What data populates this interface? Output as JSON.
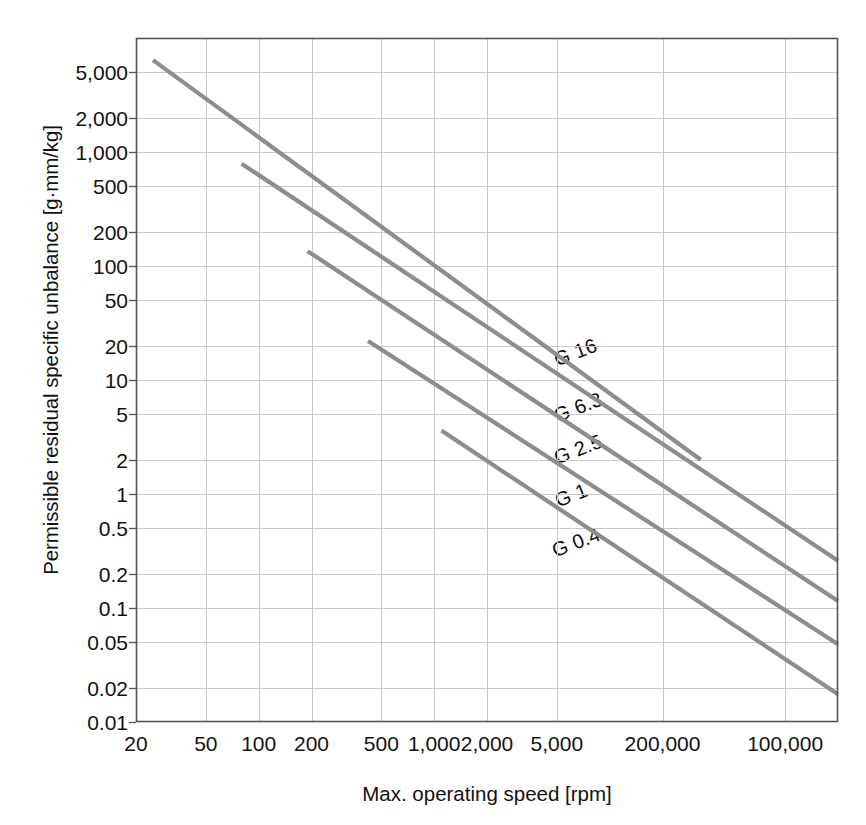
{
  "chart_data": {
    "type": "line",
    "title": "",
    "xlabel": "Max. operating speed [rpm]",
    "ylabel": "Permissible residual specific unbalance [g·mm/kg]",
    "xscale": "log",
    "yscale": "log",
    "xlim": [
      20,
      200000
    ],
    "ylim": [
      0.01,
      10000
    ],
    "grid": true,
    "legend_position": "inline-labels",
    "xticklabels": [
      "20",
      "50",
      "100",
      "200",
      "500",
      "1,000",
      "2,000",
      "5,000",
      "200,000",
      "100,000"
    ],
    "xtickvalues": [
      20,
      50,
      100,
      200,
      500,
      1000,
      2000,
      5000,
      20000,
      100000
    ],
    "yticklabels": [
      "5,000",
      "2,000",
      "1,000",
      "500",
      "200",
      "100",
      "50",
      "20",
      "10",
      "5",
      "2",
      "1",
      "0.5",
      "0.2",
      "0.1",
      "0.05",
      "0.02",
      "0.01"
    ],
    "ytickvalues": [
      5000,
      2000,
      1000,
      500,
      200,
      100,
      50,
      20,
      10,
      5,
      2,
      1,
      0.5,
      0.2,
      0.1,
      0.05,
      0.02,
      0.01
    ],
    "line_color": "#8d8d8d",
    "grid_color": "#c9c9c9",
    "axis_color": "#555555",
    "series": [
      {
        "name": "G 16",
        "label": "G 16",
        "x_start": 25,
        "y_start": 6400,
        "x_end": 33000,
        "y_end": 2.0,
        "label_x": 555,
        "label_y": 349,
        "label_angle": -21
      },
      {
        "name": "G 6.3",
        "label": "G 6.3",
        "x_start": 80,
        "y_start": 790,
        "x_end": 200000,
        "y_end": 0.26,
        "label_x": 555,
        "label_y": 405,
        "label_angle": -21
      },
      {
        "name": "G 2.5",
        "label": "G 2.5",
        "x_start": 190,
        "y_start": 135,
        "x_end": 200000,
        "y_end": 0.115,
        "label_x": 555,
        "label_y": 447,
        "label_angle": -21
      },
      {
        "name": "G 1",
        "label": "G 1",
        "x_start": 420,
        "y_start": 22,
        "x_end": 200000,
        "y_end": 0.048,
        "label_x": 556,
        "label_y": 490,
        "label_angle": -21
      },
      {
        "name": "G 0.4",
        "label": "G 0.4",
        "x_start": 1100,
        "y_start": 3.6,
        "x_end": 200000,
        "y_end": 0.0175,
        "label_x": 553,
        "label_y": 540,
        "label_angle": -21
      }
    ]
  }
}
